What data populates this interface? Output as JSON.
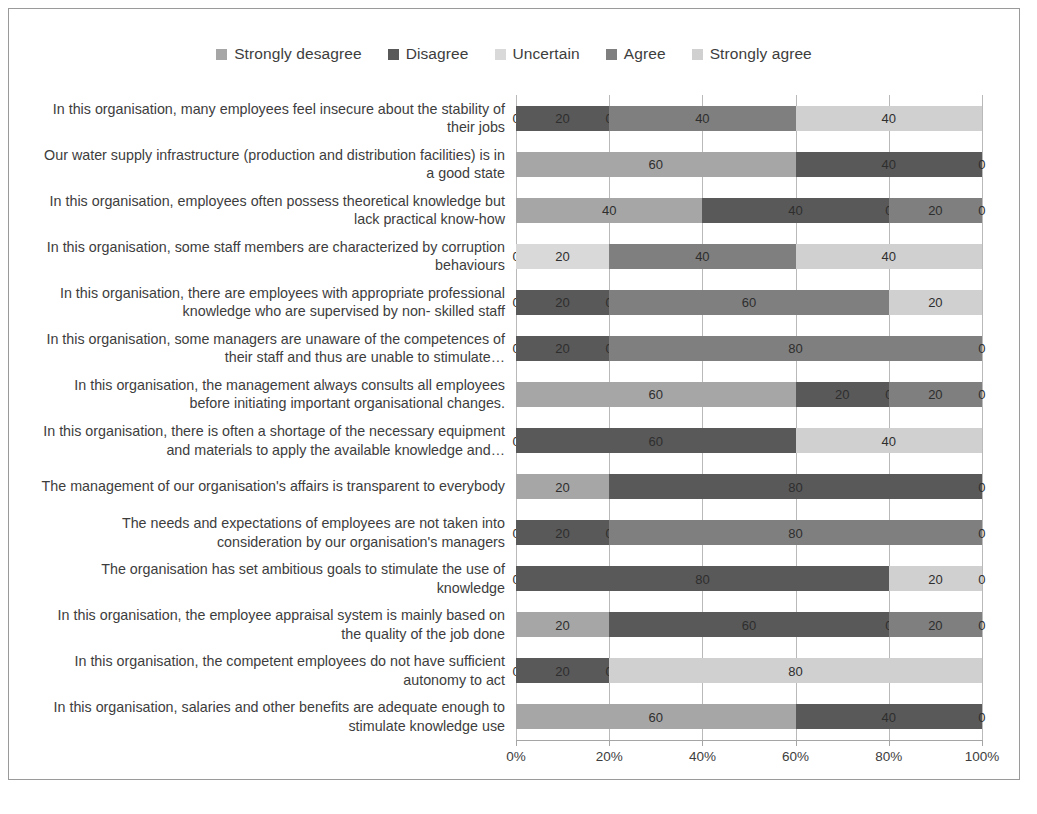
{
  "chart_data": {
    "type": "bar",
    "orientation": "horizontal",
    "stacked": true,
    "normalized_percent": true,
    "title": "",
    "xlabel": "",
    "ylabel": "",
    "xlim": [
      0,
      100
    ],
    "xticks": [
      "0%",
      "20%",
      "40%",
      "60%",
      "80%",
      "100%"
    ],
    "xtick_values": [
      0,
      20,
      40,
      60,
      80,
      100
    ],
    "grid": true,
    "legend_position": "top-center",
    "series": [
      {
        "name": "Strongly desagree",
        "color": "#a6a6a6",
        "values": [
          0,
          60,
          40,
          0,
          0,
          0,
          60,
          0,
          20,
          0,
          0,
          20,
          0,
          60
        ]
      },
      {
        "name": "Disagree",
        "color": "#595959",
        "values": [
          20,
          40,
          40,
          0,
          20,
          20,
          20,
          60,
          80,
          20,
          80,
          60,
          20,
          40
        ]
      },
      {
        "name": "Uncertain",
        "color": "#d9d9d9",
        "values": [
          0,
          0,
          0,
          20,
          0,
          0,
          0,
          0,
          0,
          0,
          0,
          0,
          0,
          0
        ]
      },
      {
        "name": "Agree",
        "color": "#7f7f7f",
        "values": [
          40,
          0,
          20,
          40,
          60,
          80,
          20,
          0,
          0,
          80,
          0,
          20,
          0,
          0
        ]
      },
      {
        "name": "Strongly agree",
        "color": "#d0d0d0",
        "values": [
          40,
          0,
          0,
          40,
          20,
          0,
          0,
          40,
          0,
          0,
          20,
          0,
          80,
          0
        ]
      }
    ],
    "categories": [
      "In this organisation, many employees feel insecure about the stability of their jobs",
      "Our water supply infrastructure (production and distribution facilities) is in a good state",
      "In this organisation, employees often possess theoretical knowledge but lack practical know-how",
      "In this organisation, some staff members are characterized by corruption behaviours",
      "In this organisation, there are employees with appropriate professional knowledge who are supervised by non- skilled staff",
      "In this organisation, some managers are unaware of the competences of their staff and thus are unable to stimulate…",
      "In this organisation, the management always consults all employees before initiating important organisational changes.",
      "In this organisation, there is often a shortage of the necessary equipment and materials to apply the available knowledge and…",
      "The management of our organisation's affairs is transparent to everybody",
      "The needs and expectations of employees are not taken into consideration by our organisation's managers",
      "The organisation has set ambitious goals to stimulate the use of knowledge",
      "In this organisation, the employee appraisal system  is mainly based on the quality of the job done",
      "In this organisation, the competent employees do not have sufficient autonomy to act",
      "In this organisation, salaries and other benefits are adequate enough to stimulate knowledge use"
    ],
    "rows": [
      {
        "label": "In this organisation, many employees feel insecure about the stability of their jobs",
        "segments": [
          {
            "series": "Strongly desagree",
            "value": 0
          },
          {
            "series": "Disagree",
            "value": 20
          },
          {
            "series": "Uncertain",
            "value": 0
          },
          {
            "series": "Agree",
            "value": 40
          },
          {
            "series": "Strongly agree",
            "value": 40
          }
        ]
      },
      {
        "label": "Our water supply infrastructure (production and distribution facilities) is in a good state",
        "segments": [
          {
            "series": "Strongly desagree",
            "value": 60
          },
          {
            "series": "Disagree",
            "value": 40
          },
          {
            "series": "Strongly agree",
            "value": 0
          }
        ]
      },
      {
        "label": "In this organisation, employees often possess theoretical knowledge but lack practical know-how",
        "segments": [
          {
            "series": "Strongly desagree",
            "value": 40
          },
          {
            "series": "Disagree",
            "value": 40
          },
          {
            "series": "Uncertain",
            "value": 0
          },
          {
            "series": "Agree",
            "value": 20
          },
          {
            "series": "Strongly agree",
            "value": 0
          }
        ]
      },
      {
        "label": "In this organisation, some staff members are characterized by corruption behaviours",
        "segments": [
          {
            "series": "Strongly desagree",
            "value": 0
          },
          {
            "series": "Uncertain",
            "value": 20
          },
          {
            "series": "Agree",
            "value": 40
          },
          {
            "series": "Strongly agree",
            "value": 40
          }
        ]
      },
      {
        "label": "In this organisation, there are employees with appropriate professional knowledge who are supervised by non- skilled staff",
        "segments": [
          {
            "series": "Strongly desagree",
            "value": 0
          },
          {
            "series": "Disagree",
            "value": 20
          },
          {
            "series": "Uncertain",
            "value": 0
          },
          {
            "series": "Agree",
            "value": 60
          },
          {
            "series": "Strongly agree",
            "value": 20
          }
        ]
      },
      {
        "label": "In this organisation, some managers are unaware of the competences of their staff and thus are unable to stimulate…",
        "segments": [
          {
            "series": "Strongly desagree",
            "value": 0
          },
          {
            "series": "Disagree",
            "value": 20
          },
          {
            "series": "Uncertain",
            "value": 0
          },
          {
            "series": "Agree",
            "value": 80
          },
          {
            "series": "Strongly agree",
            "value": 0
          }
        ]
      },
      {
        "label": "In this organisation, the management always consults all employees before initiating important organisational changes.",
        "segments": [
          {
            "series": "Strongly desagree",
            "value": 60
          },
          {
            "series": "Disagree",
            "value": 20
          },
          {
            "series": "Uncertain",
            "value": 0
          },
          {
            "series": "Agree",
            "value": 20
          },
          {
            "series": "Strongly agree",
            "value": 0
          }
        ]
      },
      {
        "label": "In this organisation, there is often a shortage of the necessary equipment and materials to apply the available knowledge and…",
        "segments": [
          {
            "series": "Strongly desagree",
            "value": 0
          },
          {
            "series": "Disagree",
            "value": 60
          },
          {
            "series": "Strongly agree",
            "value": 40
          }
        ]
      },
      {
        "label": "The management of our organisation's affairs is transparent to everybody",
        "segments": [
          {
            "series": "Strongly desagree",
            "value": 20
          },
          {
            "series": "Disagree",
            "value": 80
          },
          {
            "series": "Strongly agree",
            "value": 0
          }
        ]
      },
      {
        "label": "The needs and expectations of employees are not taken into consideration by our organisation's managers",
        "segments": [
          {
            "series": "Strongly desagree",
            "value": 0
          },
          {
            "series": "Disagree",
            "value": 20
          },
          {
            "series": "Uncertain",
            "value": 0
          },
          {
            "series": "Agree",
            "value": 80
          },
          {
            "series": "Strongly agree",
            "value": 0
          }
        ]
      },
      {
        "label": "The organisation has set ambitious goals to stimulate the use of knowledge",
        "segments": [
          {
            "series": "Strongly desagree",
            "value": 0
          },
          {
            "series": "Disagree",
            "value": 80
          },
          {
            "series": "Strongly agree",
            "value": 20
          },
          {
            "series": "Agree",
            "value": 0
          }
        ]
      },
      {
        "label": "In this organisation, the employee appraisal system  is mainly based on the quality of the job done",
        "segments": [
          {
            "series": "Strongly desagree",
            "value": 20
          },
          {
            "series": "Disagree",
            "value": 60
          },
          {
            "series": "Uncertain",
            "value": 0
          },
          {
            "series": "Agree",
            "value": 20
          },
          {
            "series": "Strongly agree",
            "value": 0
          }
        ]
      },
      {
        "label": "In this organisation, the competent employees do not have sufficient autonomy to act",
        "segments": [
          {
            "series": "Strongly desagree",
            "value": 0
          },
          {
            "series": "Disagree",
            "value": 20
          },
          {
            "series": "Uncertain",
            "value": 0
          },
          {
            "series": "Strongly agree",
            "value": 80
          }
        ]
      },
      {
        "label": "In this organisation, salaries and other benefits are adequate enough to stimulate knowledge use",
        "segments": [
          {
            "series": "Strongly desagree",
            "value": 60
          },
          {
            "series": "Disagree",
            "value": 40
          },
          {
            "series": "Strongly agree",
            "value": 0
          }
        ]
      }
    ]
  }
}
